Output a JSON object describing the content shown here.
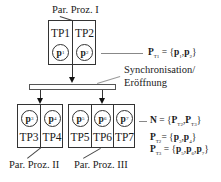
{
  "diagram": {
    "top_group": {
      "label": "Par. Proz. I",
      "cells": [
        {
          "name": "TP1",
          "process": "p",
          "index": "1"
        },
        {
          "name": "TP2",
          "process": "p",
          "index": "2"
        }
      ],
      "formula": {
        "lhs": "P",
        "lhs_sub": "T1",
        "eq": " = {",
        "items": [
          "p",
          "p"
        ],
        "subs": [
          "1",
          "2"
        ],
        "close": "}"
      }
    },
    "sync": {
      "label_line1": "Synchronisation/",
      "label_line2": "Eröffnung"
    },
    "bottom_groups": [
      {
        "label": "Par. Proz. II",
        "cells": [
          {
            "name": "TP3",
            "process": "p",
            "index": "3"
          },
          {
            "name": "TP4",
            "process": "p",
            "index": "4"
          }
        ]
      },
      {
        "label": "Par. Proz. III",
        "cells": [
          {
            "name": "TP5",
            "process": "p",
            "index": "5"
          },
          {
            "name": "TP6",
            "process": "p",
            "index": "6"
          },
          {
            "name": "TP7",
            "process": "p",
            "index": "7"
          }
        ]
      }
    ],
    "formulas": {
      "N": {
        "lhs": "N",
        "text": " = {",
        "a": "P",
        "a_sub": "T2",
        "b": "P",
        "b_sub": "T3",
        "close": "}"
      },
      "PT2": {
        "lhs": "P",
        "lhs_sub": "T2",
        "text": "= {",
        "items": "p",
        "i1": "3",
        "i2": "4",
        "close": "}"
      },
      "PT3": {
        "lhs": "P",
        "lhs_sub": "T3",
        "text": " = {",
        "i1": "5",
        "i2": "6",
        "i3": "7",
        "close": "}"
      }
    }
  }
}
